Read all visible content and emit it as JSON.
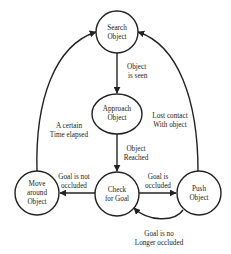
{
  "diagram": {
    "type": "state-machine",
    "nodes": {
      "search": {
        "line1": "Search",
        "line2": "Object"
      },
      "approach": {
        "line1": "Approach",
        "line2": "Object"
      },
      "check": {
        "line1": "Check",
        "line2": "for Goal"
      },
      "move": {
        "line1": "Move",
        "line2": "around",
        "line3": "Object"
      },
      "push": {
        "line1": "Push",
        "line2": "Object"
      }
    },
    "edges": {
      "search_to_approach": {
        "line1": "Object",
        "line2": "is seen"
      },
      "approach_to_check": {
        "line1": "Object",
        "line2": "Reached"
      },
      "check_to_move": {
        "line1": "Goal is not",
        "line2": "occluded"
      },
      "check_to_push": {
        "line1": "Goal is",
        "line2": "occluded"
      },
      "push_to_check": {
        "line1": "Goal is no",
        "line2": "Longer occluded"
      },
      "move_to_search": {
        "line1": "A certain",
        "line2": "Time elapsed"
      },
      "push_to_search": {
        "line1": "Lost contact",
        "line2": "With object"
      }
    },
    "colors": {
      "stroke": "#222222",
      "background": "#ffffff"
    }
  }
}
